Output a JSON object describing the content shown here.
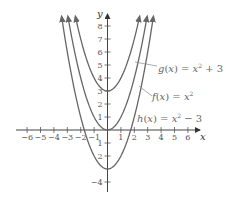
{
  "chart_data": {
    "type": "line",
    "title": "",
    "xlabel": "x",
    "ylabel": "y",
    "xlim": [
      -6.5,
      7
    ],
    "ylim": [
      -4.5,
      8.8
    ],
    "grid": false,
    "x_ticks": [
      -6,
      -5,
      -4,
      -3,
      -2,
      -1,
      1,
      2,
      3,
      4,
      5,
      6
    ],
    "y_ticks": [
      -4,
      -2,
      -1,
      1,
      2,
      3,
      4,
      5,
      6,
      7,
      8
    ],
    "x_tick_labels": [
      "−6",
      "−5",
      "−4",
      "−3",
      "−2",
      "−1",
      "1",
      "2",
      "3",
      "4",
      "5",
      "6"
    ],
    "y_tick_labels": [
      "−4",
      "2",
      "1",
      "1",
      "2",
      "3",
      "4",
      "5",
      "6",
      "7",
      "8"
    ],
    "series": [
      {
        "name": "g(x) = x² + 3",
        "formula": "x^2 + 3",
        "vertex": [
          0,
          3
        ],
        "shift": 3
      },
      {
        "name": "f(x) = x²",
        "formula": "x^2",
        "vertex": [
          0,
          0
        ],
        "shift": 0
      },
      {
        "name": "h(x) = x² − 3",
        "formula": "x^2 - 3",
        "vertex": [
          0,
          -3
        ],
        "shift": -3
      }
    ],
    "annotations": [
      {
        "text": "g(x) = x² + 3",
        "points_to": "g"
      },
      {
        "text": "f(x) = x²",
        "points_to": "f"
      },
      {
        "text": "h(x) = x² − 3",
        "points_to": "h"
      }
    ],
    "legend": "inline labels with leader lines, right side",
    "curve_color": "#666666",
    "axis_color": "#444444"
  },
  "labels": {
    "x_axis": "x",
    "y_axis": "y",
    "g": "g(x) = x² + 3",
    "f": "f(x) = x²",
    "h": "h(x) = x² − 3"
  }
}
